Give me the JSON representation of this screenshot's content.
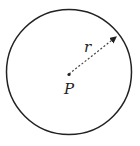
{
  "diagram": {
    "type": "circle-radius",
    "center_label": "P",
    "radius_label": "r",
    "stroke_color": "#222222",
    "background": "#ffffff"
  }
}
